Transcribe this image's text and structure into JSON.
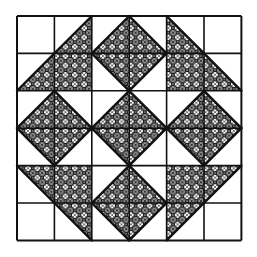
{
  "figure": {
    "grid": {
      "rows": 6,
      "cols": 6,
      "origin_x": 17,
      "origin_y": 16,
      "cell": 37.4
    },
    "colors": {
      "background": "#ffffff",
      "line": "#111111",
      "hatch": "#1a1a1a"
    },
    "cells": [
      [
        "empty",
        "lr",
        "lr",
        "ll",
        "ll",
        "empty"
      ],
      [
        "lr",
        "full",
        "ur",
        "ul",
        "full",
        "ll"
      ],
      [
        "lr",
        "ll",
        "lr",
        "ll",
        "lr",
        "ll"
      ],
      [
        "ur",
        "ul",
        "ur",
        "ul",
        "ur",
        "ul"
      ],
      [
        "ur",
        "full",
        "lr",
        "ll",
        "full",
        "ul"
      ],
      [
        "empty",
        "ur",
        "ur",
        "ul",
        "ul",
        "empty"
      ]
    ],
    "legend": {
      "empty": "blank square",
      "full": "fully hatched square",
      "lr": "hatched lower-right triangle",
      "ll": "hatched lower-left triangle",
      "ur": "hatched upper-right triangle",
      "ul": "hatched upper-left triangle"
    }
  }
}
